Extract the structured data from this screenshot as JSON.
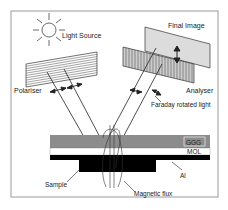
{
  "diagram": {
    "labels": {
      "light_source": "Light Source",
      "final_image": "Final Image",
      "polariser": "Polariser",
      "analyser": "Analyser",
      "faraday": "Faraday rotated light",
      "ggg": "GGG",
      "mol": "MOL",
      "al": "Al",
      "sample": "Sample",
      "magnetic_flux": "Magnetic flux"
    },
    "colors": {
      "frame": "#9a9a9a",
      "ggg_layer": "#8c8c8c",
      "mol_layer": "#ffffff",
      "al_layer": "#000000",
      "sample": "#000000",
      "final_image_plate": "#dcdcdc",
      "line": "#222222"
    }
  }
}
